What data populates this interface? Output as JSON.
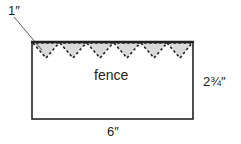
{
  "diagram": {
    "title": "fence",
    "labels": {
      "pennant": "1″",
      "width": "6″",
      "height": "2¾″",
      "center": "fence"
    },
    "pennant_count": 6,
    "colors": {
      "outline": "#222222",
      "pennant_fill": "#d9d9d9",
      "background": "#ffffff"
    }
  }
}
